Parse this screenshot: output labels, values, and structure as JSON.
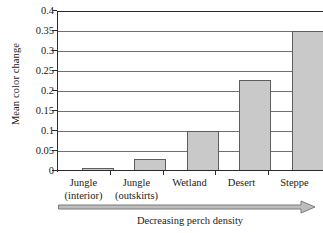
{
  "chart_data": {
    "type": "bar",
    "title": "",
    "subtitle": "",
    "xlabel": "",
    "ylabel": "Mean color change",
    "categories": [
      "Jungle (interior)",
      "Jungle (outskirts)",
      "Wetland",
      "Desert",
      "Steppe"
    ],
    "category_lines": [
      {
        "line1": "Jungle",
        "line2": "(interior)"
      },
      {
        "line1": "Jungle",
        "line2": "(outskirts)"
      },
      {
        "line1": "Wetland",
        "line2": ""
      },
      {
        "line1": "Desert",
        "line2": ""
      },
      {
        "line1": "Steppe",
        "line2": ""
      }
    ],
    "values": [
      0.008,
      0.03,
      0.1,
      0.228,
      0.35
    ],
    "ylim": [
      0,
      0.4
    ],
    "ytick_values": [
      0.4,
      0.35,
      0.3,
      0.25,
      0.2,
      0.15,
      0.1,
      0.05,
      0
    ],
    "ytick_labels": [
      "0.4",
      "0.35",
      "0.3",
      "0.25",
      "0.2",
      "0.15",
      "0.1",
      "0.05",
      "0"
    ],
    "grid": true,
    "legend": false,
    "legend_position": "none",
    "bar_fill_color": "#c9c9c9",
    "bar_border_color": "#5d5d5d",
    "gridline_color": "#6f6f6f",
    "axis_color": "#2b2b2b",
    "annotation": {
      "arrow_caption": "Decreasing perch density",
      "arrow_direction": "right",
      "arrow_color": "#8c8c8c"
    }
  }
}
